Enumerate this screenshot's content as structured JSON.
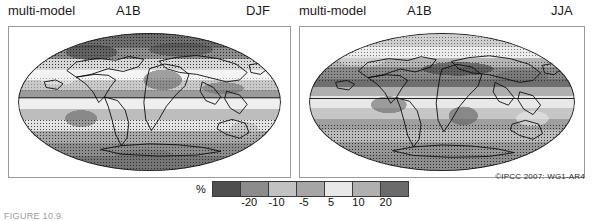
{
  "figure": {
    "credit": "©IPCC  2007: WG1-AR4",
    "caption": "FIGURE 10.9"
  },
  "panels": [
    {
      "id": "djf",
      "model_label": "multi-model",
      "scenario_label": "A1B",
      "season_label": "DJF",
      "name": "map-panel-djf"
    },
    {
      "id": "jja",
      "model_label": "multi-model",
      "scenario_label": "A1B",
      "season_label": "JJA",
      "name": "map-panel-jja"
    }
  ],
  "legend": {
    "unit": "%",
    "ticks": [
      "-20",
      "-10",
      "-5",
      "5",
      "10",
      "20"
    ],
    "swatches": [
      "#4f4f4f",
      "#8c8c8c",
      "#c2c2c2",
      "#a6a6a6",
      "#e8e8e8",
      "#b0b0b0",
      "#6b6b6b"
    ]
  },
  "chart_data": {
    "type": "heatmap",
    "subtitle": "DJF and JJA seasonal means",
    "unit": "%",
    "projection": "Mollweide (global)",
    "colorbar": {
      "label": "%",
      "boundaries": [
        -20,
        -10,
        -5,
        5,
        10,
        20
      ],
      "tick_labels": [
        "-20",
        "-10",
        "-5",
        "5",
        "10",
        "20"
      ],
      "bin_colors": [
        "#4f4f4f",
        "#8c8c8c",
        "#c2c2c2",
        "#a6a6a6",
        "#e8e8e8",
        "#b0b0b0",
        "#6b6b6b"
      ],
      "extend": "both",
      "position": "bottom-center"
    },
    "panels": [
      {
        "name": "DJF",
        "header": "multi-model   A1B   DJF",
        "stippling": "areas where magnitude of multi-model mean exceeds inter-model standard deviation",
        "regions": [
          {
            "region": "Arctic / high northern latitudes",
            "value": 20
          },
          {
            "region": "Northern Europe",
            "value": 12
          },
          {
            "region": "Mediterranean",
            "value": -12
          },
          {
            "region": "North Africa / Sahara",
            "value": -20
          },
          {
            "region": "Equatorial Pacific",
            "value": 15
          },
          {
            "region": "Southern Africa",
            "value": -12
          },
          {
            "region": "Amazonia",
            "value": -6
          },
          {
            "region": "Southern Australia",
            "value": -8
          },
          {
            "region": "Southern Ocean / Antarctica",
            "value": 12
          }
        ]
      },
      {
        "name": "JJA",
        "header": "multi-model   A1B   JJA",
        "stippling": "areas where magnitude of multi-model mean exceeds inter-model standard deviation",
        "regions": [
          {
            "region": "Arctic / high northern latitudes",
            "value": 10
          },
          {
            "region": "Mediterranean / Southern Europe",
            "value": -20
          },
          {
            "region": "Middle East",
            "value": -20
          },
          {
            "region": "Central America",
            "value": -15
          },
          {
            "region": "Amazonia",
            "value": -10
          },
          {
            "region": "South Asia monsoon",
            "value": 10
          },
          {
            "region": "Equatorial Pacific",
            "value": 12
          },
          {
            "region": "Southern Africa",
            "value": -8
          },
          {
            "region": "Southern Ocean / Antarctica",
            "value": 12
          }
        ]
      }
    ],
    "legend_position": "bottom-center",
    "grid": false
  }
}
